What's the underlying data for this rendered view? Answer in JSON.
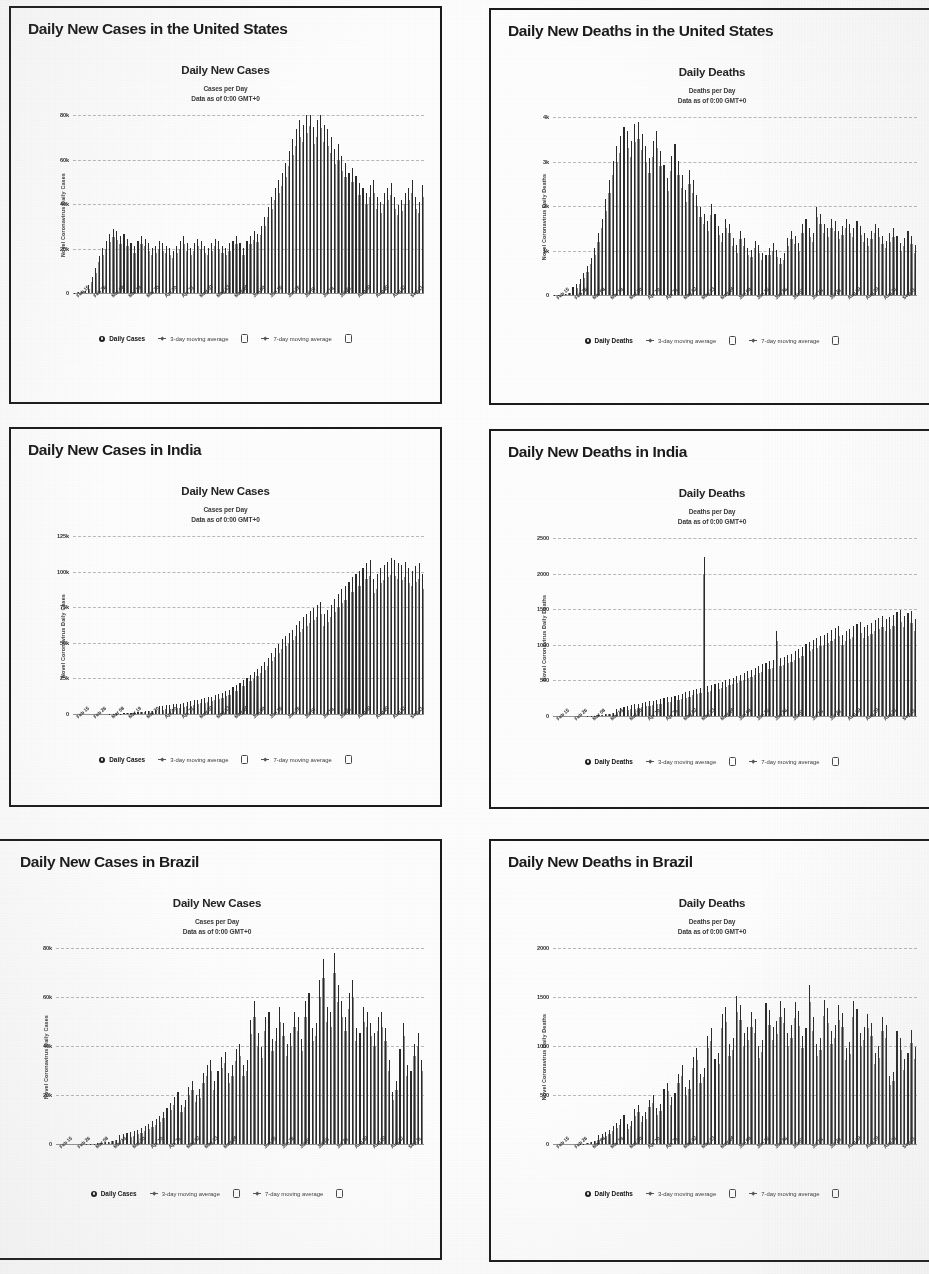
{
  "document": {
    "kind": "scanned-report-page",
    "panel_count": 6
  },
  "shared": {
    "cases_chart_title": "Daily New Cases",
    "deaths_chart_title": "Daily Deaths",
    "cases_subtitle_line1": "Cases per Day",
    "deaths_subtitle_line1": "Deaths per Day",
    "subtitle_line2": "Data as of 0:00 GMT+0",
    "ylabel_cases": "Novel Coronavirus Daily Cases",
    "ylabel_deaths": "Novel Coronavirus Daily Deaths",
    "legend_cases": [
      {
        "label": "Daily Cases",
        "icon": "filled-dot-icon",
        "primary": true
      },
      {
        "label": "3-day moving average",
        "icon": "line-marker-icon",
        "primary": false
      },
      {
        "label": "",
        "icon": "checkbox-icon",
        "primary": false
      },
      {
        "label": "7-day moving average",
        "icon": "line-marker-icon",
        "primary": false
      },
      {
        "label": "",
        "icon": "checkbox-icon",
        "primary": false
      }
    ],
    "legend_deaths": [
      {
        "label": "Daily Deaths",
        "icon": "filled-dot-icon",
        "primary": true
      },
      {
        "label": "3-day moving average",
        "icon": "line-marker-icon",
        "primary": false
      },
      {
        "label": "",
        "icon": "checkbox-icon",
        "primary": false
      },
      {
        "label": "7-day moving average",
        "icon": "line-marker-icon",
        "primary": false
      },
      {
        "label": "",
        "icon": "checkbox-icon",
        "primary": false
      }
    ],
    "xtick_labels": [
      "Feb 15",
      "Feb 26",
      "Mar 08",
      "Mar 19",
      "Mar 30",
      "Apr 10",
      "Apr 21",
      "May 02",
      "May 13",
      "May 24",
      "Jun 04",
      "Jun 15",
      "Jun 26",
      "Jul 07",
      "Jul 18",
      "Jul 29",
      "Aug 09",
      "Aug 20",
      "Aug 31",
      "Sep 11"
    ],
    "colors": {
      "bar": "#777777",
      "spike": "#2a2a2a",
      "border": "#1b1b1b",
      "text": "#1a1a1a",
      "gridline": "#5a5a5a"
    }
  },
  "panels": [
    {
      "id": "us-cases",
      "title": "Daily New Cases in the United States"
    },
    {
      "id": "us-deaths",
      "title": "Daily New Deaths in the United States"
    },
    {
      "id": "india-cases",
      "title": "Daily New Cases in India"
    },
    {
      "id": "india-deaths",
      "title": "Daily New Deaths in India"
    },
    {
      "id": "brazil-cases",
      "title": "Daily New Cases in Brazil"
    },
    {
      "id": "brazil-deaths",
      "title": "Daily New Deaths in Brazil"
    }
  ],
  "chart_data": [
    {
      "id": "us-cases",
      "type": "bar",
      "title": "Daily New Cases",
      "subtitle": "Cases per Day / Data as of 0:00 GMT+0",
      "panel_title": "Daily New Cases in the United States",
      "xlabel": "",
      "ylabel": "Novel Coronavirus Daily Cases",
      "ylim": [
        0,
        80000
      ],
      "ytick_values": [
        0,
        20000,
        40000,
        60000,
        80000
      ],
      "ytick_labels": [
        "0",
        "20k",
        "40k",
        "60k",
        "80k"
      ],
      "grid": true,
      "legend_position": "bottom",
      "categories": [
        "Feb 15",
        "Feb 26",
        "Mar 08",
        "Mar 19",
        "Mar 30",
        "Apr 10",
        "Apr 21",
        "May 02",
        "May 13",
        "May 24",
        "Jun 04",
        "Jun 15",
        "Jun 26",
        "Jul 07",
        "Jul 18",
        "Jul 29",
        "Aug 09",
        "Aug 20",
        "Aug 31",
        "Sep 11"
      ],
      "values": [
        200,
        300,
        400,
        900,
        2000,
        5000,
        9000,
        14000,
        17000,
        20000,
        23000,
        25000,
        24000,
        22000,
        23000,
        21000,
        19000,
        18000,
        20000,
        22000,
        21000,
        19000,
        17000,
        18000,
        20000,
        19000,
        18000,
        17000,
        16000,
        18000,
        20000,
        22000,
        19000,
        17000,
        19000,
        21000,
        20000,
        18000,
        17000,
        19000,
        21000,
        20000,
        18000,
        17000,
        19000,
        20000,
        22000,
        19000,
        17000,
        20000,
        22000,
        24000,
        23000,
        26000,
        30000,
        34000,
        38000,
        42000,
        45000,
        48000,
        52000,
        57000,
        62000,
        66000,
        70000,
        68000,
        72000,
        75000,
        67000,
        70000,
        74000,
        68000,
        66000,
        63000,
        58000,
        60000,
        55000,
        52000,
        48000,
        50000,
        47000,
        44000,
        42000,
        40000,
        43000,
        45000,
        38000,
        36000,
        40000,
        42000,
        44000,
        38000,
        35000,
        37000,
        40000,
        42000,
        45000,
        38000,
        36000,
        43000
      ],
      "series_overlay": [
        {
          "name": "3-day moving average",
          "style": "line"
        },
        {
          "name": "7-day moving average",
          "style": "line"
        }
      ]
    },
    {
      "id": "us-deaths",
      "type": "bar",
      "title": "Daily Deaths",
      "subtitle": "Deaths per Day / Data as of 0:00 GMT+0",
      "panel_title": "Daily New Deaths in the United States",
      "xlabel": "",
      "ylabel": "Novel Coronavirus Daily Deaths",
      "ylim": [
        0,
        4000
      ],
      "ytick_values": [
        0,
        1000,
        2000,
        3000,
        4000
      ],
      "ytick_labels": [
        "0",
        "1k",
        "2k",
        "3k",
        "4k"
      ],
      "grid": true,
      "legend_position": "bottom",
      "categories": [
        "Feb 15",
        "Feb 26",
        "Mar 08",
        "Mar 19",
        "Mar 30",
        "Apr 10",
        "Apr 21",
        "May 02",
        "May 13",
        "May 24",
        "Jun 04",
        "Jun 15",
        "Jun 26",
        "Jul 07",
        "Jul 18",
        "Jul 29",
        "Aug 09",
        "Aug 20",
        "Aug 31",
        "Sep 11"
      ],
      "values": [
        5,
        8,
        12,
        20,
        40,
        90,
        160,
        260,
        380,
        520,
        700,
        900,
        1200,
        1500,
        1900,
        2300,
        2700,
        3000,
        3200,
        3400,
        3300,
        3100,
        3450,
        3500,
        3250,
        3000,
        2750,
        3100,
        3300,
        2900,
        2600,
        2350,
        2800,
        3050,
        2700,
        2400,
        2100,
        2500,
        2300,
        2000,
        1750,
        1600,
        1450,
        1800,
        1600,
        1350,
        1200,
        1500,
        1400,
        1100,
        950,
        1250,
        1100,
        900,
        850,
        1050,
        950,
        800,
        750,
        900,
        1000,
        850,
        700,
        800,
        1100,
        1250,
        1150,
        1000,
        1400,
        1500,
        1300,
        1200,
        1750,
        1600,
        1400,
        1300,
        1500,
        1450,
        1250,
        1350,
        1500,
        1400,
        1300,
        1450,
        1350,
        1200,
        1100,
        1250,
        1400,
        1300,
        1150,
        1050,
        1200,
        1300,
        1150,
        1000,
        1100,
        1250,
        1150,
        950
      ],
      "series_overlay": [
        {
          "name": "3-day moving average",
          "style": "line"
        },
        {
          "name": "7-day moving average",
          "style": "line"
        }
      ]
    },
    {
      "id": "india-cases",
      "type": "bar",
      "title": "Daily New Cases",
      "subtitle": "Cases per Day / Data as of 0:00 GMT+0",
      "panel_title": "Daily New Cases in India",
      "xlabel": "",
      "ylabel": "Novel Coronavirus Daily Cases",
      "ylim": [
        0,
        125000
      ],
      "ytick_values": [
        0,
        25000,
        50000,
        75000,
        100000,
        125000
      ],
      "ytick_labels": [
        "0",
        "25k",
        "50k",
        "75k",
        "100k",
        "125k"
      ],
      "grid": true,
      "legend_position": "bottom",
      "categories": [
        "Feb 15",
        "Feb 26",
        "Mar 08",
        "Mar 19",
        "Mar 30",
        "Apr 10",
        "Apr 21",
        "May 02",
        "May 13",
        "May 24",
        "Jun 04",
        "Jun 15",
        "Jun 26",
        "Jul 07",
        "Jul 18",
        "Jul 29",
        "Aug 09",
        "Aug 20",
        "Aug 31",
        "Sep 11"
      ],
      "values": [
        0,
        0,
        0,
        0,
        0,
        0,
        0,
        0,
        10,
        30,
        60,
        100,
        200,
        350,
        500,
        700,
        900,
        1100,
        1300,
        1500,
        1700,
        1900,
        2100,
        2400,
        2700,
        3000,
        3300,
        3600,
        3900,
        4200,
        4500,
        5000,
        5500,
        6000,
        6500,
        7000,
        7500,
        8000,
        8500,
        9000,
        9800,
        10500,
        11500,
        12500,
        13500,
        15000,
        16500,
        18000,
        19500,
        21000,
        23000,
        25000,
        27000,
        29000,
        31000,
        34000,
        37000,
        40000,
        43000,
        46000,
        48000,
        50000,
        52000,
        55000,
        58000,
        60000,
        62000,
        64000,
        66000,
        68000,
        70000,
        62000,
        65000,
        68000,
        72000,
        75000,
        78000,
        80000,
        83000,
        86000,
        88000,
        90000,
        92000,
        95000,
        97000,
        85000,
        88000,
        92000,
        94000,
        96000,
        98000,
        97000,
        95000,
        94000,
        96000,
        92000,
        90000,
        93000,
        95000,
        88000
      ],
      "series_overlay": [
        {
          "name": "3-day moving average",
          "style": "line"
        },
        {
          "name": "7-day moving average",
          "style": "line"
        }
      ]
    },
    {
      "id": "india-deaths",
      "type": "bar",
      "title": "Daily Deaths",
      "subtitle": "Deaths per Day / Data as of 0:00 GMT+0",
      "panel_title": "Daily New Deaths in India",
      "xlabel": "",
      "ylabel": "Novel Coronavirus Daily Deaths",
      "ylim": [
        0,
        2500
      ],
      "ytick_values": [
        0,
        500,
        1000,
        1500,
        2000,
        2500
      ],
      "ytick_labels": [
        "0",
        "500",
        "1000",
        "1500",
        "2000",
        "2500"
      ],
      "grid": true,
      "legend_position": "bottom",
      "annotations": [
        {
          "label": "one-day reporting spike",
          "approx_value": 2000,
          "near_category": "Jun 15"
        }
      ],
      "categories": [
        "Feb 15",
        "Feb 26",
        "Mar 08",
        "Mar 19",
        "Mar 30",
        "Apr 10",
        "Apr 21",
        "May 02",
        "May 13",
        "May 24",
        "Jun 04",
        "Jun 15",
        "Jun 26",
        "Jul 07",
        "Jul 18",
        "Jul 29",
        "Aug 09",
        "Aug 20",
        "Aug 31",
        "Sep 11"
      ],
      "values": [
        0,
        0,
        0,
        0,
        0,
        0,
        0,
        0,
        1,
        2,
        4,
        7,
        12,
        18,
        25,
        33,
        42,
        52,
        62,
        72,
        82,
        95,
        105,
        115,
        125,
        135,
        145,
        155,
        165,
        175,
        185,
        195,
        205,
        215,
        230,
        245,
        260,
        275,
        290,
        305,
        320,
        2000,
        340,
        355,
        370,
        385,
        400,
        415,
        430,
        450,
        470,
        490,
        510,
        530,
        550,
        575,
        600,
        620,
        640,
        660,
        680,
        1050,
        700,
        720,
        740,
        760,
        790,
        820,
        850,
        880,
        910,
        940,
        960,
        980,
        1000,
        1030,
        1060,
        1090,
        1120,
        1000,
        1050,
        1080,
        1110,
        1140,
        1170,
        1100,
        1130,
        1160,
        1190,
        1220,
        1250,
        1200,
        1230,
        1260,
        1290,
        1320,
        1250,
        1280,
        1310,
        1200
      ],
      "series_overlay": [
        {
          "name": "3-day moving average",
          "style": "line"
        },
        {
          "name": "7-day moving average",
          "style": "line"
        }
      ]
    },
    {
      "id": "brazil-cases",
      "type": "bar",
      "title": "Daily New Cases",
      "subtitle": "Cases per Day / Data as of 0:00 GMT+0",
      "panel_title": "Daily New Cases in Brazil",
      "xlabel": "",
      "ylabel": "Novel Coronavirus Daily Cases",
      "ylim": [
        0,
        80000
      ],
      "ytick_values": [
        0,
        20000,
        40000,
        60000,
        80000
      ],
      "ytick_labels": [
        "0",
        "20k",
        "40k",
        "60k",
        "80k"
      ],
      "grid": true,
      "legend_position": "bottom",
      "categories": [
        "Feb 15",
        "Feb 26",
        "Mar 08",
        "Mar 19",
        "Mar 30",
        "Apr 10",
        "Apr 21",
        "May 02",
        "May 13",
        "May 24",
        "Jun 04",
        "Jun 15",
        "Jun 26",
        "Jul 07",
        "Jul 18",
        "Jul 29",
        "Aug 09",
        "Aug 20",
        "Aug 31",
        "Sep 11"
      ],
      "values": [
        0,
        0,
        0,
        0,
        0,
        0,
        0,
        20,
        60,
        120,
        200,
        350,
        500,
        700,
        900,
        1200,
        1500,
        1800,
        2200,
        2600,
        3000,
        3500,
        4000,
        4500,
        5200,
        6000,
        7000,
        8000,
        9000,
        10500,
        12000,
        14000,
        16000,
        18000,
        13000,
        15000,
        20000,
        22000,
        17000,
        19000,
        25000,
        28000,
        30000,
        22000,
        26000,
        31000,
        33000,
        25000,
        28000,
        34000,
        36000,
        28000,
        30000,
        45000,
        52000,
        40000,
        35000,
        46000,
        48000,
        38000,
        42000,
        50000,
        44000,
        36000,
        40000,
        48000,
        46000,
        38000,
        52000,
        55000,
        42000,
        44000,
        60000,
        68000,
        50000,
        48000,
        70000,
        58000,
        52000,
        46000,
        55000,
        60000,
        42000,
        40000,
        50000,
        48000,
        44000,
        40000,
        46000,
        48000,
        42000,
        30000,
        18000,
        22000,
        34000,
        44000,
        28000,
        26000,
        36000,
        40000,
        30000
      ],
      "series_overlay": [
        {
          "name": "3-day moving average",
          "style": "line"
        },
        {
          "name": "7-day moving average",
          "style": "line"
        }
      ]
    },
    {
      "id": "brazil-deaths",
      "type": "bar",
      "title": "Daily Deaths",
      "subtitle": "Deaths per Day / Data as of 0:00 GMT+0",
      "panel_title": "Daily New Deaths in Brazil",
      "xlabel": "",
      "ylabel": "Novel Coronavirus Daily Deaths",
      "ylim": [
        0,
        2000
      ],
      "ytick_values": [
        0,
        500,
        1000,
        1500,
        2000
      ],
      "ytick_labels": [
        "0",
        "500",
        "1000",
        "1500",
        "2000"
      ],
      "grid": true,
      "legend_position": "bottom",
      "categories": [
        "Feb 15",
        "Feb 26",
        "Mar 08",
        "Mar 19",
        "Mar 30",
        "Apr 10",
        "Apr 21",
        "May 02",
        "May 13",
        "May 24",
        "Jun 04",
        "Jun 15",
        "Jun 26",
        "Jul 07",
        "Jul 18",
        "Jul 29",
        "Aug 09",
        "Aug 20",
        "Aug 31",
        "Sep 11"
      ],
      "values": [
        0,
        0,
        0,
        0,
        0,
        0,
        0,
        2,
        5,
        10,
        18,
        30,
        45,
        60,
        80,
        100,
        130,
        160,
        200,
        240,
        150,
        180,
        290,
        330,
        230,
        260,
        380,
        420,
        300,
        340,
        480,
        540,
        400,
        440,
        620,
        700,
        500,
        560,
        780,
        860,
        620,
        680,
        980,
        1050,
        760,
        820,
        1180,
        1250,
        900,
        960,
        1350,
        1270,
        1000,
        1060,
        1200,
        1130,
        880,
        940,
        1280,
        1220,
        1060,
        1120,
        1300,
        1240,
        1000,
        1080,
        1290,
        1210,
        980,
        1050,
        1450,
        1150,
        900,
        960,
        1310,
        1240,
        1020,
        1080,
        1270,
        1190,
        860,
        920,
        1300,
        1230,
        1000,
        1060,
        1180,
        1100,
        820,
        880,
        1150,
        1080,
        600,
        640,
        1020,
        960,
        760,
        820,
        1030,
        870
      ],
      "series_overlay": [
        {
          "name": "3-day moving average",
          "style": "line"
        },
        {
          "name": "7-day moving average",
          "style": "line"
        }
      ]
    }
  ]
}
